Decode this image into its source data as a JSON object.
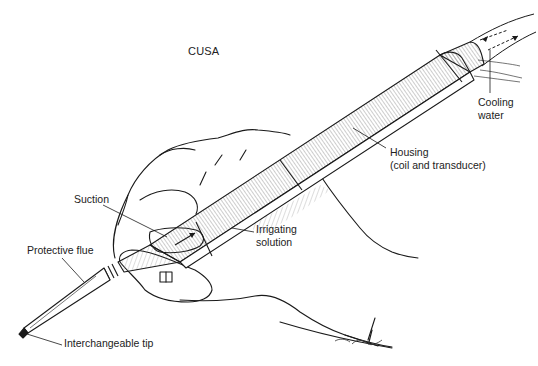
{
  "diagram": {
    "title": "CUSA",
    "labels": {
      "cooling_water": {
        "line1": "Cooling",
        "line2": "water"
      },
      "housing": {
        "line1": "Housing",
        "line2": "(coil and transducer)"
      },
      "suction": "Suction",
      "irrigating_solution": {
        "line1": "Irrigating",
        "line2": "solution"
      },
      "protective_flue": "Protective flue",
      "interchangeable_tip": "Interchangeable tip"
    },
    "colors": {
      "ink": "#1a1a1a",
      "background": "#ffffff",
      "hatch": "#555555"
    }
  }
}
